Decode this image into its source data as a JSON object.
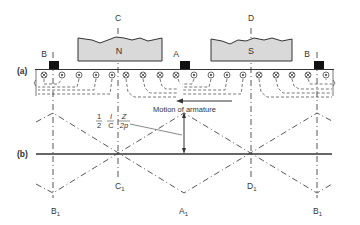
{
  "diagram": {
    "part_labels": {
      "a": "(a)",
      "b": "(b)"
    },
    "poles": [
      {
        "name": "N",
        "label": "N"
      },
      {
        "name": "S",
        "label": "S"
      }
    ],
    "axis_labels_top": {
      "C": "C",
      "D": "D"
    },
    "brush_labels": {
      "B_left": "B",
      "A": "A",
      "B_right": "B"
    },
    "bottom_labels": {
      "B1_left": "B",
      "B1_left_sub": "1",
      "C1": "C",
      "C1_sub": "1",
      "A1": "A",
      "A1_sub": "1",
      "D1": "D",
      "D1_sub": "1",
      "B1_right": "B",
      "B1_right_sub": "1"
    },
    "motion_label": "Motion of armature",
    "formula": {
      "f1_num": "1",
      "f1_den": "2",
      "f2_num": "I",
      "f2_den": "C",
      "f3_num": "Z",
      "f3_den": "2p"
    },
    "conductor_symbols": {
      "dot": "current out of page",
      "cross": "current into page"
    },
    "colors": {
      "pole_fill": "#d9d9d9",
      "line": "#333333",
      "brush": "#111111"
    }
  }
}
